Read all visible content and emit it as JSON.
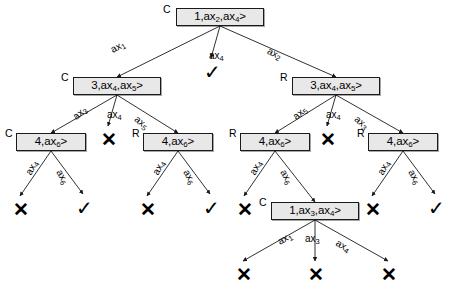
{
  "diagram": {
    "type": "tree",
    "stroke_color": "#1a1a1a",
    "node_fill": "#e8e8e8",
    "symbols": {
      "fail": "✕",
      "success": "✓",
      "closed_tag": "C",
      "open_tag": "R"
    },
    "nodes": [
      {
        "id": "n0",
        "tag": "C",
        "label": "<ax₁,ax₂,ax₄>",
        "parts": [
          "<ax",
          "1",
          ",ax",
          "2",
          ",ax",
          "4",
          ">"
        ],
        "x": 176,
        "y": 8,
        "w": 88,
        "h": 18,
        "tag_x": 163,
        "tag_y": 4
      },
      {
        "id": "n1",
        "tag": "C",
        "label": "<ax₃,ax₄,ax₅>",
        "parts": [
          "<ax",
          "3",
          ",ax",
          "4",
          ",ax",
          "5",
          ">"
        ],
        "x": 73,
        "y": 77,
        "w": 88,
        "h": 18,
        "tag_x": 61,
        "tag_y": 72
      },
      {
        "id": "n2",
        "tag": "R",
        "label": "<ax₃,ax₄,ax₅>",
        "parts": [
          "<ax",
          "3",
          ",ax",
          "4",
          ",ax",
          "5",
          ">"
        ],
        "x": 292,
        "y": 77,
        "w": 88,
        "h": 18,
        "tag_x": 280,
        "tag_y": 72
      },
      {
        "id": "n3",
        "tag": "C",
        "label": "<ax₄,ax₆>",
        "parts": [
          "<ax",
          "4",
          ",ax",
          "6",
          ">"
        ],
        "x": 16,
        "y": 133,
        "w": 70,
        "h": 18,
        "tag_x": 5,
        "tag_y": 128
      },
      {
        "id": "n4",
        "tag": "R",
        "label": "<ax₄,ax₆>",
        "parts": [
          "<ax",
          "4",
          ",ax",
          "6",
          ">"
        ],
        "x": 143,
        "y": 133,
        "w": 70,
        "h": 18,
        "tag_x": 132,
        "tag_y": 128
      },
      {
        "id": "n5",
        "tag": "R",
        "label": "<ax₄,ax₆>",
        "parts": [
          "<ax",
          "4",
          ",ax",
          "6",
          ">"
        ],
        "x": 240,
        "y": 133,
        "w": 70,
        "h": 18,
        "tag_x": 229,
        "tag_y": 128
      },
      {
        "id": "n6",
        "tag": "R",
        "label": "<ax₄,ax₆>",
        "parts": [
          "<ax",
          "4",
          ",ax",
          "6",
          ">"
        ],
        "x": 368,
        "y": 133,
        "w": 70,
        "h": 18,
        "tag_x": 357,
        "tag_y": 128
      },
      {
        "id": "n7",
        "tag": "C",
        "label": "<ax₁,ax₃,ax₄>",
        "parts": [
          "<ax",
          "1",
          ",ax",
          "3",
          ",ax",
          "4",
          ">"
        ],
        "x": 271,
        "y": 202,
        "w": 88,
        "h": 18,
        "tag_x": 259,
        "tag_y": 197
      }
    ],
    "edges": [
      {
        "from": "n0",
        "to": "n1",
        "label_base": "ax",
        "label_sub": "1",
        "lx": 109,
        "ly": 46,
        "rot": -28
      },
      {
        "from": "n0",
        "to": "check1",
        "label_base": "ax",
        "label_sub": "4",
        "lx": 209,
        "ly": 51,
        "rot": 0
      },
      {
        "from": "n0",
        "to": "n2",
        "label_base": "ax",
        "label_sub": "2",
        "lx": 270,
        "ly": 46,
        "rot": 26
      },
      {
        "from": "n1",
        "to": "n3",
        "label_base": "ax",
        "label_sub": "3",
        "lx": 71,
        "ly": 114,
        "rot": -40
      },
      {
        "from": "n1",
        "to": "cross1",
        "label_base": "ax",
        "label_sub": "4",
        "lx": 107,
        "ly": 110,
        "rot": 0
      },
      {
        "from": "n1",
        "to": "n4",
        "label_base": "ax",
        "label_sub": "5",
        "lx": 139,
        "ly": 114,
        "rot": 40
      },
      {
        "from": "n2",
        "to": "n5",
        "label_base": "ax",
        "label_sub": "5",
        "lx": 291,
        "ly": 114,
        "rot": -40
      },
      {
        "from": "n2",
        "to": "cross2",
        "label_base": "ax",
        "label_sub": "4",
        "lx": 326,
        "ly": 110,
        "rot": 0
      },
      {
        "from": "n2",
        "to": "n6",
        "label_base": "ax",
        "label_sub": "3",
        "lx": 359,
        "ly": 114,
        "rot": 40
      },
      {
        "from": "n3",
        "to": "cross3",
        "label_base": "ax",
        "label_sub": "4",
        "lx": 24,
        "ly": 172,
        "rot": -62
      },
      {
        "from": "n3",
        "to": "check2",
        "label_base": "ax",
        "label_sub": "6",
        "lx": 63,
        "ly": 168,
        "rot": 60
      },
      {
        "from": "n4",
        "to": "cross4",
        "label_base": "ax",
        "label_sub": "4",
        "lx": 151,
        "ly": 172,
        "rot": -62
      },
      {
        "from": "n4",
        "to": "check3",
        "label_base": "ax",
        "label_sub": "6",
        "lx": 190,
        "ly": 168,
        "rot": 60
      },
      {
        "from": "n5",
        "to": "cross5",
        "label_base": "ax",
        "label_sub": "4",
        "lx": 248,
        "ly": 172,
        "rot": -62
      },
      {
        "from": "n5",
        "to": "n7",
        "label_base": "ax",
        "label_sub": "6",
        "lx": 287,
        "ly": 168,
        "rot": 60
      },
      {
        "from": "n6",
        "to": "cross6",
        "label_base": "ax",
        "label_sub": "4",
        "lx": 376,
        "ly": 172,
        "rot": -62
      },
      {
        "from": "n6",
        "to": "check4",
        "label_base": "ax",
        "label_sub": "6",
        "lx": 415,
        "ly": 168,
        "rot": 60
      },
      {
        "from": "n7",
        "to": "cross7",
        "label_base": "ax",
        "label_sub": "1",
        "lx": 276,
        "ly": 238,
        "rot": -30
      },
      {
        "from": "n7",
        "to": "cross8",
        "label_base": "ax",
        "label_sub": "3",
        "lx": 305,
        "ly": 234,
        "rot": 0
      },
      {
        "from": "n7",
        "to": "cross9",
        "label_base": "ax",
        "label_sub": "4",
        "lx": 339,
        "ly": 238,
        "rot": 30
      }
    ],
    "leaves": [
      {
        "id": "check1",
        "kind": "success",
        "glyph": "✓",
        "x": 204,
        "y": 62
      },
      {
        "id": "cross1",
        "kind": "fail",
        "glyph": "✕",
        "x": 101,
        "y": 130
      },
      {
        "id": "cross2",
        "kind": "fail",
        "glyph": "✕",
        "x": 320,
        "y": 130
      },
      {
        "id": "cross3",
        "kind": "fail",
        "glyph": "✕",
        "x": 13,
        "y": 200
      },
      {
        "id": "check2",
        "kind": "success",
        "glyph": "✓",
        "x": 76,
        "y": 198
      },
      {
        "id": "cross4",
        "kind": "fail",
        "glyph": "✕",
        "x": 140,
        "y": 200
      },
      {
        "id": "check3",
        "kind": "success",
        "glyph": "✓",
        "x": 203,
        "y": 198
      },
      {
        "id": "cross5",
        "kind": "fail",
        "glyph": "✕",
        "x": 237,
        "y": 200
      },
      {
        "id": "cross6",
        "kind": "fail",
        "glyph": "✕",
        "x": 365,
        "y": 200
      },
      {
        "id": "check4",
        "kind": "success",
        "glyph": "✓",
        "x": 428,
        "y": 198
      },
      {
        "id": "cross7",
        "kind": "fail",
        "glyph": "✕",
        "x": 236,
        "y": 265
      },
      {
        "id": "cross8",
        "kind": "fail",
        "glyph": "✕",
        "x": 308,
        "y": 265
      },
      {
        "id": "cross9",
        "kind": "fail",
        "glyph": "✕",
        "x": 381,
        "y": 265
      }
    ]
  }
}
